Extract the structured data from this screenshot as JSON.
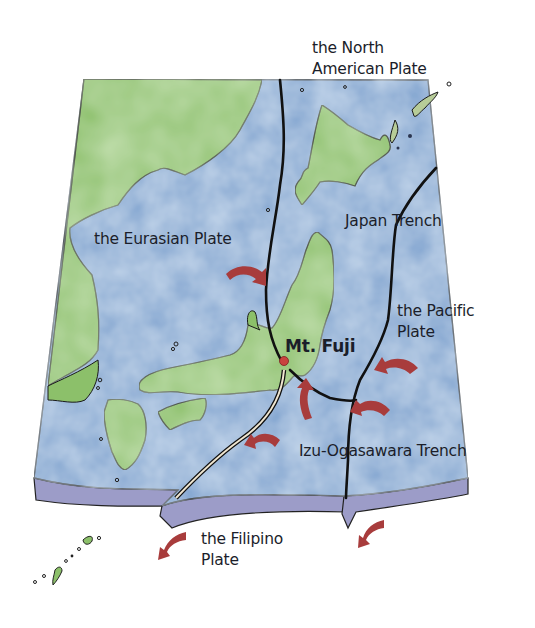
{
  "map": {
    "title": "Plate tectonics around Japan and Mt. Fuji",
    "labels": {
      "north_american_plate": "the North\nAmerican Plate",
      "eurasian_plate": "the Eurasian Plate",
      "japan_trench": "Japan Trench",
      "pacific_plate": "the Pacific\nPlate",
      "mt_fuji": "Mt. Fuji",
      "izu_ogasawara_trench": "Izu-Ogasawara Trench",
      "filipino_plate": "the Filipino\nPlate"
    },
    "colors": {
      "land": "#8cc06a",
      "sea": "#7fa3cf",
      "sea_light": "#a9c4e2",
      "plate_edge": "#9c9cc8",
      "boundary": "#1a1a1a",
      "arrow": "#a83c3c",
      "fuji_marker": "#c9433f",
      "text": "#1b1e2a"
    },
    "features": {
      "plates": [
        "the North American Plate",
        "the Eurasian Plate",
        "the Pacific Plate",
        "the Filipino Plate"
      ],
      "trenches": [
        "Japan Trench",
        "Izu-Ogasawara Trench"
      ],
      "landmark": "Mt. Fuji",
      "arrow_count": 8
    }
  }
}
